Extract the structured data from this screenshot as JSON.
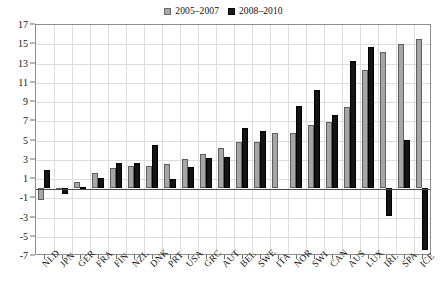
{
  "chart_data": {
    "type": "bar",
    "title": "",
    "subtitle": "",
    "xlabel": "",
    "ylabel": "",
    "ylim": [
      -7,
      17
    ],
    "ytick_step": 2,
    "yticks": [
      17,
      15,
      13,
      11,
      9,
      7,
      5,
      3,
      1,
      -1,
      -3,
      -5,
      -7
    ],
    "grid": true,
    "legend_position": "top-center",
    "categories": [
      "NLD",
      "JPN",
      "GER",
      "FRA",
      "FIN",
      "NZL",
      "DNK",
      "PRT",
      "USA",
      "GRC",
      "AUT",
      "BEL",
      "SWE",
      "ITA",
      "NOR",
      "SWI",
      "CAN",
      "AUS",
      "LUX",
      "IRL",
      "SPA",
      "ICE"
    ],
    "series": [
      {
        "name": "2005–2007",
        "color": "#a6a6a6",
        "values": [
          -1.3,
          -0.1,
          0.6,
          1.5,
          2.0,
          2.2,
          2.2,
          2.5,
          3.0,
          3.5,
          4.1,
          4.7,
          4.7,
          5.7,
          5.7,
          6.5,
          6.8,
          8.4,
          12.2,
          14.1,
          14.9,
          15.4
        ]
      },
      {
        "name": "2008–2010",
        "color": "#141414",
        "values": [
          1.8,
          -0.7,
          0.1,
          1.0,
          2.6,
          2.6,
          4.4,
          0.9,
          2.1,
          3.1,
          3.2,
          6.2,
          5.9,
          0.0,
          8.5,
          10.1,
          7.5,
          13.2,
          14.6,
          -2.9,
          4.9,
          -6.5
        ]
      }
    ]
  },
  "legend": {
    "entries": [
      {
        "label": "2005–2007",
        "swatch": "grey-square-icon"
      },
      {
        "label": "2008–2010",
        "swatch": "black-square-icon"
      }
    ]
  },
  "axes": {
    "y_tick_labels": [
      "17",
      "15",
      "13",
      "11",
      "9",
      "7",
      "5",
      "3",
      "1",
      "-1",
      "-3",
      "-5",
      "-7"
    ],
    "x_tick_labels": [
      "NLD",
      "JPN",
      "GER",
      "FRA",
      "FIN",
      "NZL",
      "DNK",
      "PRT",
      "USA",
      "GRC",
      "AUT",
      "BEL",
      "SWE",
      "ITA",
      "NOR",
      "SWI",
      "CAN",
      "AUS",
      "LUX",
      "IRL",
      "SPA",
      "ICE"
    ]
  },
  "colors": {
    "series_1": "#a6a6a6",
    "series_2": "#141414",
    "grid": "#dcdcdc",
    "frame": "#8d8d8d",
    "zero_line": "#4a4a4a",
    "text": "#151515",
    "background": "#ffffff"
  }
}
